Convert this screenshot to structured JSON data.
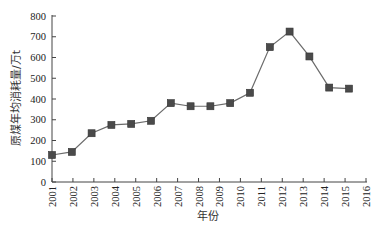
{
  "chart_data": {
    "type": "line",
    "title": "",
    "xlabel": "年份",
    "ylabel": "原煤年均消耗量/万t",
    "x_tick_labels": [
      "2001",
      "2002",
      "2003",
      "2004",
      "2005",
      "2006",
      "2007",
      "2008",
      "2009",
      "2010",
      "2011",
      "2012",
      "2013",
      "2014",
      "2015",
      "2016"
    ],
    "y_ticks": [
      0,
      100,
      200,
      300,
      400,
      500,
      600,
      700,
      800
    ],
    "ylim": [
      0,
      800
    ],
    "grid": false,
    "legend": null,
    "marker": "square",
    "series": [
      {
        "name": "原煤年均消耗量",
        "x": [
          2001,
          2002,
          2003,
          2004,
          2005,
          2006,
          2007,
          2008,
          2009,
          2010,
          2011,
          2012,
          2013,
          2014,
          2015,
          2016
        ],
        "values": [
          130,
          145,
          235,
          275,
          280,
          295,
          380,
          365,
          365,
          380,
          430,
          650,
          725,
          605,
          455,
          450
        ]
      }
    ]
  },
  "colors": {
    "line": "#6b6b6b",
    "marker": "#4a4a4a",
    "axis": "#444444"
  }
}
